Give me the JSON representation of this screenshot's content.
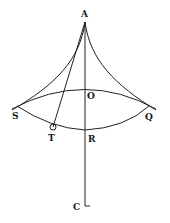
{
  "diagram": {
    "type": "geometric-figure",
    "stroke_color": "#222222",
    "background": "#ffffff",
    "points": {
      "A": {
        "label": "A",
        "x": 85,
        "y": 22,
        "label_x": 81,
        "label_y": 17
      },
      "O": {
        "label": "O",
        "x": 85,
        "y": 89,
        "label_x": 87,
        "label_y": 99
      },
      "S": {
        "label": "S",
        "x": 17,
        "y": 106,
        "label_x": 12,
        "label_y": 119
      },
      "Q": {
        "label": "Q",
        "x": 149,
        "y": 106,
        "label_x": 145,
        "label_y": 120
      },
      "T": {
        "label": "T",
        "x": 53,
        "y": 127,
        "label_x": 48,
        "label_y": 141
      },
      "R": {
        "label": "R",
        "x": 85,
        "y": 130,
        "label_x": 88,
        "label_y": 142
      },
      "C": {
        "label": "C",
        "x": 85,
        "y": 206,
        "label_x": 73,
        "label_y": 210
      }
    },
    "elements": [
      {
        "kind": "curve",
        "from": "A",
        "to": "S",
        "style": "concave cusp"
      },
      {
        "kind": "curve",
        "from": "A",
        "to": "Q",
        "style": "concave cusp"
      },
      {
        "kind": "arc",
        "from": "S",
        "to": "Q",
        "through": "O",
        "style": "upper arc"
      },
      {
        "kind": "arc",
        "from": "S",
        "to": "Q",
        "through": "R",
        "style": "lower arc"
      },
      {
        "kind": "line",
        "from": "A",
        "to": "C",
        "style": "vertical axis"
      },
      {
        "kind": "line",
        "from": "A",
        "to": "T"
      },
      {
        "kind": "circle",
        "center": "T",
        "radius": 3
      }
    ]
  }
}
